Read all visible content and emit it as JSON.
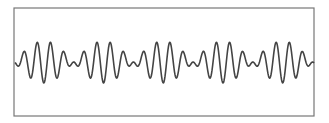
{
  "chart_data": {
    "type": "line",
    "title": "",
    "xlabel": "",
    "ylabel": "",
    "grid": false,
    "legend": null,
    "model": {
      "formula": "y = sin(2*pi*f1*x) + sin(2*pi*f2*x)",
      "carrier_period_px": 13.27,
      "beat_period_px": 59.7,
      "cycles_per_beat": 4.5,
      "beats_shown": 5
    },
    "series": [
      {
        "name": "signal",
        "color": "#444444",
        "line_width": 1.6
      }
    ],
    "xlim": [
      0,
      300
    ],
    "ylim": [
      -2.2,
      2.2
    ]
  },
  "frame": {
    "left": 14,
    "top": 8,
    "right": 314,
    "bottom": 116,
    "border_color": "#777777"
  }
}
